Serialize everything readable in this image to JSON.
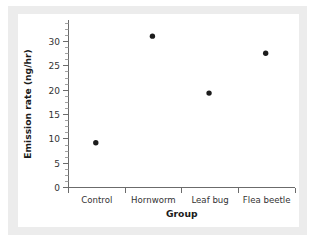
{
  "chart_data": {
    "type": "scatter",
    "title": "",
    "xlabel": "Group",
    "ylabel": "Emission rate (ng/hr)",
    "categories": [
      "Control",
      "Hornworm",
      "Leaf bug",
      "Flea beetle"
    ],
    "values": [
      9.2,
      31.1,
      19.4,
      27.6
    ],
    "series": [
      {
        "name": "Mean emission rate",
        "values": [
          9.2,
          31.1,
          19.4,
          27.6
        ]
      }
    ],
    "ylim": [
      0,
      33
    ],
    "y_ticks": [
      0,
      5,
      10,
      15,
      20,
      25,
      30
    ],
    "y_tick_labels": [
      "0",
      "5",
      "10",
      "15",
      "20",
      "25",
      "30"
    ],
    "y_minor_step": 1.25,
    "grid": false,
    "legend": false,
    "legend_position": "none",
    "marker": "filled-circle",
    "marker_color": "#1c1c1c",
    "axis_color": "#6b6b6b",
    "background_color": "#ffffff",
    "mat_color": "#ececec"
  },
  "figure": {
    "y_axis_title": "Emission rate (ng/hr)",
    "x_axis_title": "Group",
    "tick_labels": {
      "y0": "0",
      "y5": "5",
      "y10": "10",
      "y15": "15",
      "y20": "20",
      "y25": "25",
      "y30": "30"
    },
    "category_labels": {
      "c0": "Control",
      "c1": "Hornworm",
      "c2": "Leaf bug",
      "c3": "Flea beetle"
    }
  }
}
